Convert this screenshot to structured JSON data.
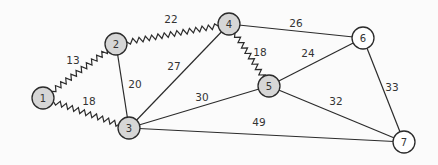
{
  "graph": {
    "colors": {
      "visited": "#d6d6d6",
      "unvisited": "#ffffff",
      "stroke": "#2b2b2b",
      "background": "#fbfbfb"
    },
    "node_radius": 11,
    "nodes": [
      {
        "id": "1",
        "label": "1",
        "x": 43,
        "y": 98,
        "visited": true
      },
      {
        "id": "2",
        "label": "2",
        "x": 116,
        "y": 44,
        "visited": true
      },
      {
        "id": "3",
        "label": "3",
        "x": 129,
        "y": 128,
        "visited": true
      },
      {
        "id": "4",
        "label": "4",
        "x": 229,
        "y": 24,
        "visited": true
      },
      {
        "id": "5",
        "label": "5",
        "x": 269,
        "y": 86,
        "visited": true
      },
      {
        "id": "6",
        "label": "6",
        "x": 363,
        "y": 38,
        "visited": false
      },
      {
        "id": "7",
        "label": "7",
        "x": 404,
        "y": 142,
        "visited": false
      }
    ],
    "edges": [
      {
        "from": "1",
        "to": "2",
        "weight": "13",
        "style": "zigzag",
        "label_x": 73,
        "label_y": 60
      },
      {
        "from": "1",
        "to": "3",
        "weight": "18",
        "style": "zigzag",
        "label_x": 89,
        "label_y": 101
      },
      {
        "from": "2",
        "to": "4",
        "weight": "22",
        "style": "zigzag",
        "label_x": 171,
        "label_y": 19
      },
      {
        "from": "2",
        "to": "3",
        "weight": "20",
        "style": "straight",
        "label_x": 135,
        "label_y": 84
      },
      {
        "from": "3",
        "to": "4",
        "weight": "27",
        "style": "straight",
        "label_x": 174,
        "label_y": 66
      },
      {
        "from": "3",
        "to": "5",
        "weight": "30",
        "style": "straight",
        "label_x": 202,
        "label_y": 97
      },
      {
        "from": "3",
        "to": "7",
        "weight": "49",
        "style": "straight",
        "label_x": 259,
        "label_y": 122
      },
      {
        "from": "4",
        "to": "6",
        "weight": "26",
        "style": "straight",
        "label_x": 296,
        "label_y": 23
      },
      {
        "from": "4",
        "to": "5",
        "weight": "18",
        "style": "zigzag",
        "label_x": 260,
        "label_y": 52
      },
      {
        "from": "5",
        "to": "6",
        "weight": "24",
        "style": "straight",
        "label_x": 308,
        "label_y": 53
      },
      {
        "from": "5",
        "to": "7",
        "weight": "32",
        "style": "straight",
        "label_x": 336,
        "label_y": 101
      },
      {
        "from": "6",
        "to": "7",
        "weight": "33",
        "style": "straight",
        "label_x": 392,
        "label_y": 87
      }
    ]
  }
}
